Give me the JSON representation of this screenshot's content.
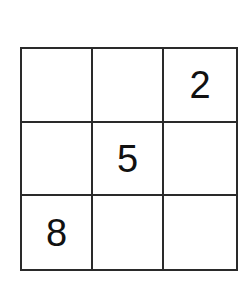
{
  "puzzle": {
    "rows": 3,
    "cols": 3,
    "cells": [
      [
        "",
        "",
        "2"
      ],
      [
        "",
        "5",
        ""
      ],
      [
        "8",
        "",
        ""
      ]
    ]
  }
}
